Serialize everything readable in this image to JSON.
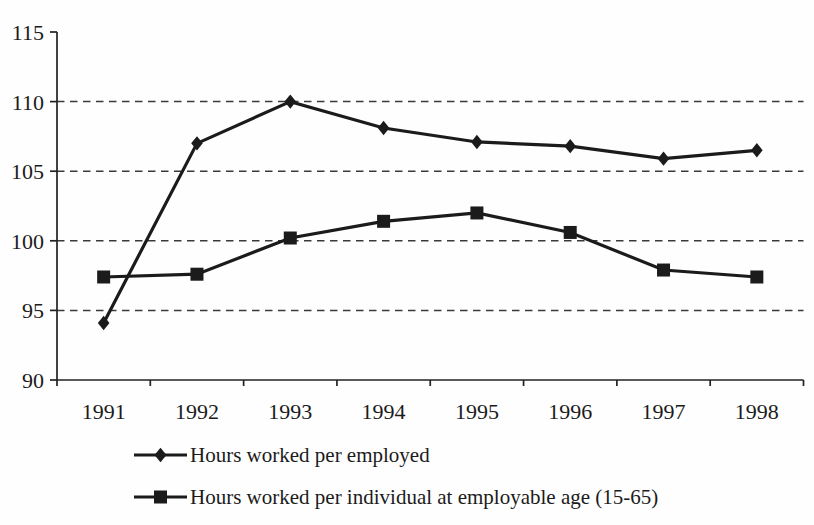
{
  "chart_data": {
    "type": "line",
    "categories": [
      "1991",
      "1992",
      "1993",
      "1994",
      "1995",
      "1996",
      "1997",
      "1998"
    ],
    "series": [
      {
        "name": "Hours worked per employed",
        "marker": "diamond",
        "values": [
          94.1,
          107.0,
          110.0,
          108.1,
          107.1,
          106.8,
          105.9,
          106.5
        ]
      },
      {
        "name": "Hours worked per individual at employable age (15-65)",
        "marker": "square",
        "values": [
          97.4,
          97.6,
          100.2,
          101.4,
          102.0,
          100.6,
          97.9,
          97.4
        ]
      }
    ],
    "title": "",
    "xlabel": "",
    "ylabel": "",
    "ylim": [
      90,
      115
    ],
    "yticks": [
      90,
      95,
      100,
      105,
      110,
      115
    ],
    "grid": "horizontal-dashed",
    "legend_position": "bottom-left",
    "line_color": "#1b1b1b",
    "background_color": "#fefefe"
  }
}
